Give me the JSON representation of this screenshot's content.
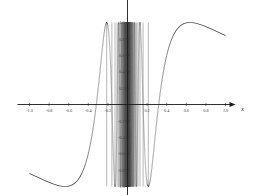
{
  "figure": {
    "title": "",
    "background_color": "#ffffff",
    "curve_color": "#6e6e6e",
    "axis_color": "#1a1a1a",
    "label_color": "#3a3a3a"
  },
  "axes": {
    "x_name": "x",
    "y_name": "y",
    "x_arrow": "arrow-right",
    "y_arrow": "arrow-up"
  },
  "chart_data": {
    "type": "line",
    "title": "",
    "subtitle": "",
    "xlabel": "x",
    "ylabel": "y",
    "xlim": [
      -1.0,
      1.0
    ],
    "ylim": [
      -1.0,
      1.0
    ],
    "grid": false,
    "legend": "none",
    "function": "sin(1/x)",
    "xticks": [
      -1.0,
      -0.8,
      -0.6,
      -0.4,
      -0.2,
      0.2,
      0.4,
      0.6,
      0.8,
      1.0
    ],
    "xticklabels": [
      "-1.0",
      "-0.8",
      "-0.6",
      "-0.4",
      "-0.2",
      "0.2",
      "0.4",
      "0.6",
      "0.8",
      "1.0"
    ],
    "yticks": [
      -1.0,
      -0.8,
      -0.6,
      -0.4,
      -0.2,
      0.2,
      0.4,
      0.6,
      0.8,
      1.0
    ],
    "yticklabels": [
      "-1.0",
      "-0.8",
      "-0.6",
      "-0.4",
      "-0.2",
      "0.2",
      "0.4",
      "0.6",
      "0.8",
      "1.0"
    ],
    "series": [
      {
        "name": "sin(1/x)",
        "color": "#6e6e6e",
        "x": [
          -1.0,
          -0.95,
          -0.9,
          -0.85,
          -0.8,
          -0.75,
          -0.7,
          -0.65,
          -0.6,
          -0.55,
          -0.5,
          -0.45,
          -0.4,
          -0.35,
          -0.3,
          -0.25,
          -0.2,
          -0.15,
          -0.1,
          -0.05,
          0.05,
          0.1,
          0.15,
          0.2,
          0.25,
          0.3,
          0.35,
          0.4,
          0.45,
          0.5,
          0.55,
          0.6,
          0.65,
          0.7,
          0.75,
          0.8,
          0.85,
          0.9,
          0.95,
          1.0
        ],
        "y": [
          -0.841,
          -0.864,
          -0.891,
          -0.921,
          -0.949,
          -0.972,
          -0.99,
          -0.999,
          -0.995,
          -0.973,
          -0.909,
          -0.778,
          -0.598,
          -0.304,
          0.191,
          0.757,
          0.959,
          -0.326,
          -0.544,
          0.913,
          -0.913,
          0.544,
          0.326,
          -0.959,
          -0.757,
          -0.191,
          0.304,
          0.598,
          0.778,
          0.909,
          0.973,
          0.995,
          0.999,
          0.99,
          0.972,
          0.949,
          0.921,
          0.891,
          0.864,
          0.841
        ]
      }
    ],
    "notes": [
      "Left lobe: single large positive arch peaking near x = -0.7 (value -0.999 of sin(1/x) mirrored; visually a crest above the axis around x = -0.7).",
      "Dense oscillation band spans roughly -0.22 < x < 0.22 where frequency diverges.",
      "Right lobe: large negative trough centred near x = 0.7."
    ]
  },
  "ticks": {
    "x": [
      {
        "label": "-1.0",
        "value": -1.0
      },
      {
        "label": "-0.8",
        "value": -0.8
      },
      {
        "label": "-0.6",
        "value": -0.6
      },
      {
        "label": "-0.4",
        "value": -0.4
      },
      {
        "label": "-0.2",
        "value": -0.2
      },
      {
        "label": "0.2",
        "value": 0.2
      },
      {
        "label": "0.4",
        "value": 0.4
      },
      {
        "label": "0.6",
        "value": 0.6
      },
      {
        "label": "0.8",
        "value": 0.8
      },
      {
        "label": "1.0",
        "value": 1.0
      }
    ],
    "y": [
      {
        "label": "1.0",
        "value": 1.0
      },
      {
        "label": "0.8",
        "value": 0.8
      },
      {
        "label": "0.6",
        "value": 0.6
      },
      {
        "label": "0.4",
        "value": 0.4
      },
      {
        "label": "0.2",
        "value": 0.2
      },
      {
        "label": "-0.2",
        "value": -0.2
      },
      {
        "label": "-0.4",
        "value": -0.4
      },
      {
        "label": "-0.6",
        "value": -0.6
      },
      {
        "label": "-0.8",
        "value": -0.8
      },
      {
        "label": "-1.0",
        "value": -1.0
      }
    ]
  }
}
